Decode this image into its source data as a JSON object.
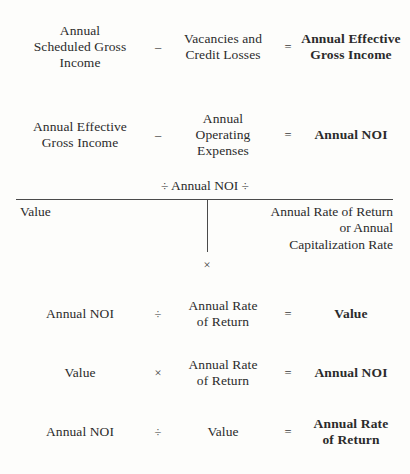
{
  "diagram": {
    "text_color": "#2b2b2b",
    "rule_color": "#4a4a4a",
    "background_color": "#fdfdfb",
    "equations": [
      {
        "id": "effective-gross-income",
        "left": "Annual\nScheduled Gross\nIncome",
        "left_lines": [
          "Annual",
          "Scheduled Gross",
          "Income"
        ],
        "operator1": "–",
        "middle_lines": [
          "Vacancies and",
          "Credit Losses"
        ],
        "operator2": "=",
        "result_lines": [
          "Annual Effective",
          "Gross Income"
        ]
      },
      {
        "id": "net-operating-income",
        "left_lines": [
          "Annual Effective",
          "Gross Income"
        ],
        "operator1": "–",
        "middle_lines": [
          "Annual",
          "Operating",
          "Expenses"
        ],
        "operator2": "=",
        "result_lines": [
          "Annual NOI"
        ]
      }
    ],
    "divider": {
      "id": "noi-divider",
      "top_label": "÷ Annual NOI ÷",
      "left_label": "Value",
      "right_lines": [
        "Annual Rate of Return",
        "or Annual",
        "Capitalization Rate"
      ],
      "times_symbol": "×"
    },
    "derived_equations": [
      {
        "id": "value-from-noi",
        "left_lines": [
          "Annual NOI"
        ],
        "operator1": "÷",
        "middle_lines": [
          "Annual Rate",
          "of Return"
        ],
        "operator2": "=",
        "result_lines": [
          "Value"
        ]
      },
      {
        "id": "noi-from-value",
        "left_lines": [
          "Value"
        ],
        "operator1": "×",
        "middle_lines": [
          "Annual Rate",
          "of Return"
        ],
        "operator2": "=",
        "result_lines": [
          "Annual NOI"
        ]
      },
      {
        "id": "rate-from-noi-and-value",
        "left_lines": [
          "Annual NOI"
        ],
        "operator1": "÷",
        "middle_lines": [
          "Value"
        ],
        "operator2": "=",
        "result_lines": [
          "Annual Rate",
          "of Return"
        ]
      }
    ]
  }
}
